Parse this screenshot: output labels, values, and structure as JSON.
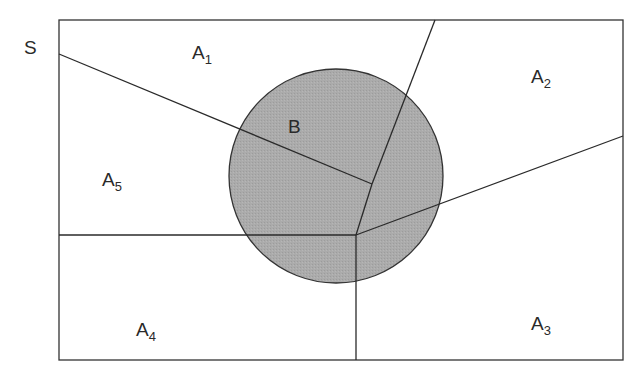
{
  "diagram": {
    "universe_label": "S",
    "circle_label": "B",
    "regions": [
      {
        "base": "A",
        "sub": "1"
      },
      {
        "base": "A",
        "sub": "2"
      },
      {
        "base": "A",
        "sub": "3"
      },
      {
        "base": "A",
        "sub": "4"
      },
      {
        "base": "A",
        "sub": "5"
      }
    ],
    "colors": {
      "stroke": "#333333",
      "circle_fill": "#a9a9a9",
      "background": "#ffffff"
    }
  }
}
